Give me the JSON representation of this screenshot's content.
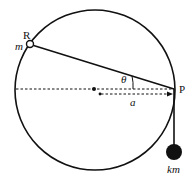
{
  "diagram": {
    "type": "physics-mechanics",
    "labels": {
      "ring_point": "R",
      "ring_mass": "m",
      "pivot_point": "P",
      "angle": "θ",
      "distance": "a",
      "hanging_mass": "km"
    },
    "colors": {
      "stroke": "#111111",
      "background": "#ffffff"
    },
    "geometry": {
      "circle_center": [
        95,
        90
      ],
      "circle_radius": 80,
      "ring_position": [
        30,
        44
      ],
      "pivot_position": [
        174,
        90
      ],
      "hanging_mass_position": [
        174,
        152
      ],
      "hanging_mass_radius": 8
    }
  }
}
